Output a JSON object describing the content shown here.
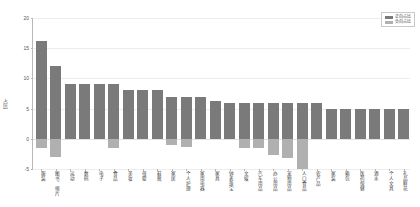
{
  "chart_data": {
    "type": "bar",
    "title": "",
    "subtitle": "",
    "xlabel": "",
    "ylabel": "占比",
    "ylim": [
      -5,
      20
    ],
    "yticks": [
      -5,
      0,
      5,
      10,
      15,
      20
    ],
    "ytick_labels": [
      "-5",
      "0",
      "5",
      "10",
      "15",
      "20"
    ],
    "grid": true,
    "grid_axis": "y",
    "legend_position": "upper right",
    "categories": [
      "服装",
      "图书、唱片",
      "运动",
      "数码",
      "电子",
      "食品",
      "美妆",
      "母婴",
      "鞋靴",
      "家居",
      "个人护理",
      "家用电器",
      "家具",
      "钟表珠宝",
      "文娱",
      "汽车用品",
      "办公用品",
      "宠物用品",
      "人口食品",
      "农产品",
      "家装",
      "箱包",
      "医药保健",
      "酒水",
      "个人文具",
      "礼品鲜花"
    ],
    "series": [
      {
        "name": "正向占比",
        "color": "#7a7a7a",
        "values": [
          16.2,
          12.0,
          9.0,
          9.0,
          9.0,
          9.1,
          8.0,
          8.0,
          8.1,
          7.0,
          7.0,
          7.0,
          6.2,
          6.0,
          6.0,
          6.0,
          6.0,
          6.0,
          6.0,
          6.0,
          5.0,
          5.0,
          5.0,
          5.0,
          5.0,
          5.0
        ]
      },
      {
        "name": "负向占比",
        "color": "#b0b0b0",
        "values": [
          -1.5,
          -3.0,
          0.0,
          0.0,
          0.0,
          -1.6,
          0.0,
          0.0,
          0.0,
          -1.0,
          -1.3,
          0.0,
          0.0,
          0.0,
          -1.6,
          -1.6,
          -2.7,
          -3.2,
          -5.0,
          0.0,
          0.0,
          0.0,
          0.0,
          0.0,
          0.0,
          0.0
        ]
      }
    ]
  }
}
